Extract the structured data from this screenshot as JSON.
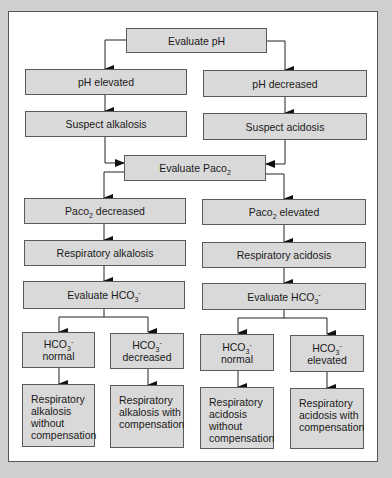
{
  "diagram": {
    "type": "flowchart",
    "nodes": {
      "evaluate_ph": "Evaluate pH",
      "ph_elevated": "pH elevated",
      "ph_decreased": "pH decreased",
      "suspect_alkalosis": "Suspect alkalosis",
      "suspect_acidosis": "Suspect acidosis",
      "evaluate_paco2": {
        "main": "Evaluate Paco",
        "sub": "2"
      },
      "paco2_decreased": {
        "pre": "Paco",
        "sub": "2",
        "post": " decreased"
      },
      "paco2_elevated": {
        "pre": "Paco",
        "sub": "2",
        "post": " elevated"
      },
      "respiratory_alkalosis": "Respiratory alkalosis",
      "respiratory_acidosis": "Respiratory acidosis",
      "evaluate_hco3_left": {
        "main": "Evaluate HCO",
        "sub": "3",
        "sup": "-"
      },
      "evaluate_hco3_right": {
        "main": "Evaluate HCO",
        "sub": "3",
        "sup": "-"
      },
      "hco3_normal_left": {
        "main": "HCO",
        "sub": "3",
        "sup": "-",
        "state": "normal"
      },
      "hco3_decreased": {
        "main": "HCO",
        "sub": "3",
        "sup": "-",
        "state": "decreased"
      },
      "hco3_normal_right": {
        "main": "HCO",
        "sub": "3",
        "sup": "-",
        "state": "normal"
      },
      "hco3_elevated": {
        "main": "HCO",
        "sub": "3",
        "sup": "-",
        "state": "elevated"
      },
      "result_1": [
        "Respiratory",
        "alkalosis",
        "without",
        "compensation"
      ],
      "result_2": [
        "Respiratory",
        "alkalosis with",
        "compensation"
      ],
      "result_3": [
        "Respiratory",
        "acidosis",
        "without",
        "compensation"
      ],
      "result_4": [
        "Respiratory",
        "acidosis with",
        "compensation"
      ]
    },
    "edges": [
      [
        "evaluate_ph",
        "ph_elevated"
      ],
      [
        "evaluate_ph",
        "ph_decreased"
      ],
      [
        "ph_elevated",
        "suspect_alkalosis"
      ],
      [
        "ph_decreased",
        "suspect_acidosis"
      ],
      [
        "suspect_alkalosis",
        "evaluate_paco2"
      ],
      [
        "suspect_acidosis",
        "evaluate_paco2"
      ],
      [
        "evaluate_paco2",
        "paco2_decreased"
      ],
      [
        "evaluate_paco2",
        "paco2_elevated"
      ],
      [
        "paco2_decreased",
        "respiratory_alkalosis"
      ],
      [
        "paco2_elevated",
        "respiratory_acidosis"
      ],
      [
        "respiratory_alkalosis",
        "evaluate_hco3_left"
      ],
      [
        "respiratory_acidosis",
        "evaluate_hco3_right"
      ],
      [
        "evaluate_hco3_left",
        "hco3_normal_left"
      ],
      [
        "evaluate_hco3_left",
        "hco3_decreased"
      ],
      [
        "evaluate_hco3_right",
        "hco3_normal_right"
      ],
      [
        "evaluate_hco3_right",
        "hco3_elevated"
      ],
      [
        "hco3_normal_left",
        "result_1"
      ],
      [
        "hco3_decreased",
        "result_2"
      ],
      [
        "hco3_normal_right",
        "result_3"
      ],
      [
        "hco3_elevated",
        "result_4"
      ]
    ],
    "colors": {
      "box_fill": "#d9d9d9",
      "border": "#5a5a5a",
      "background": "#cfcfcf",
      "panel": "#ffffff"
    }
  }
}
